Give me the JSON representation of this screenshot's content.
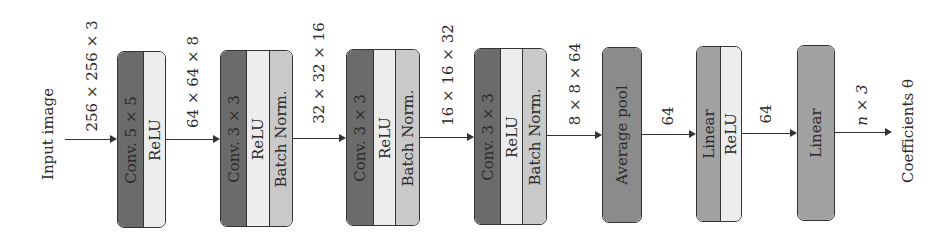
{
  "colors": {
    "conv": "#6b6b6b",
    "relu": "#ededed",
    "batchnorm": "#c9c9c9",
    "avgpool": "#8b8b8b",
    "linear": "#a2a2a2",
    "stroke": "#333333"
  },
  "input_label": "Input image",
  "output_label": "Coefficients θ",
  "edge_labels": [
    "256 × 256 × 3",
    "64 × 64 × 8",
    "32 × 32 × 16",
    "16 × 16 × 32",
    "8 × 8 × 64",
    "64",
    "64",
    "n × 3"
  ],
  "blocks": [
    {
      "name": "block-1",
      "layers": [
        "Conv. 5 × 5",
        "ReLU"
      ]
    },
    {
      "name": "block-2",
      "layers": [
        "Conv. 3 × 3",
        "ReLU",
        "Batch Norm."
      ]
    },
    {
      "name": "block-3",
      "layers": [
        "Conv. 3 × 3",
        "ReLU",
        "Batch Norm."
      ]
    },
    {
      "name": "block-4",
      "layers": [
        "Conv. 3 × 3",
        "ReLU",
        "Batch Norm."
      ]
    },
    {
      "name": "block-5",
      "layers": [
        "Average pool"
      ]
    },
    {
      "name": "block-6",
      "layers": [
        "Linear",
        "ReLU"
      ]
    },
    {
      "name": "block-7",
      "layers": [
        "Linear"
      ]
    }
  ]
}
